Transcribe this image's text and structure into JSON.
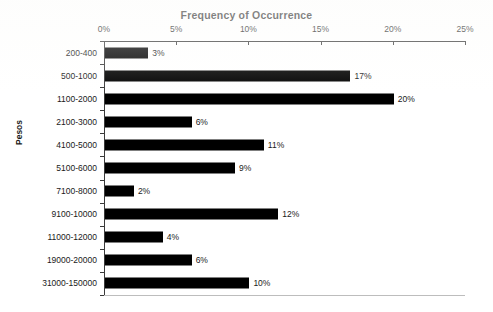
{
  "chart_data": {
    "type": "bar",
    "orientation": "horizontal",
    "title": "Frequency of Occurrence",
    "subtitle": "",
    "xlabel": "",
    "ylabel": "Pesos",
    "xlim": [
      0,
      25
    ],
    "xticks": [
      "0%",
      "5%",
      "10%",
      "15%",
      "20%",
      "25%"
    ],
    "xtick_values": [
      0,
      5,
      10,
      15,
      20,
      25
    ],
    "grid": false,
    "legend": "none",
    "bar_color": "#000000",
    "axis_color": "#3a3a3a",
    "background_color": "#ffffff",
    "value_suffix": "%",
    "categories": [
      "200-400",
      "500-1000",
      "1100-2000",
      "2100-3000",
      "4100-5000",
      "5100-6000",
      "7100-8000",
      "9100-10000",
      "11000-12000",
      "19000-20000",
      "31000-150000"
    ],
    "values": [
      3,
      17,
      20,
      6,
      11,
      9,
      2,
      12,
      4,
      6,
      10
    ],
    "data_labels": [
      "3%",
      "17%",
      "20%",
      "6%",
      "11%",
      "9%",
      "2%",
      "12%",
      "4%",
      "6%",
      "10%"
    ],
    "points": [
      {
        "category": "200-400",
        "value": 3,
        "label": "3%"
      },
      {
        "category": "500-1000",
        "value": 17,
        "label": "17%"
      },
      {
        "category": "1100-2000",
        "value": 20,
        "label": "20%"
      },
      {
        "category": "2100-3000",
        "value": 6,
        "label": "6%"
      },
      {
        "category": "4100-5000",
        "value": 11,
        "label": "11%"
      },
      {
        "category": "5100-6000",
        "value": 9,
        "label": "9%"
      },
      {
        "category": "7100-8000",
        "value": 2,
        "label": "2%"
      },
      {
        "category": "9100-10000",
        "value": 12,
        "label": "12%"
      },
      {
        "category": "11000-12000",
        "value": 4,
        "label": "4%"
      },
      {
        "category": "19000-20000",
        "value": 6,
        "label": "6%"
      },
      {
        "category": "31000-150000",
        "value": 10,
        "label": "10%"
      }
    ]
  }
}
